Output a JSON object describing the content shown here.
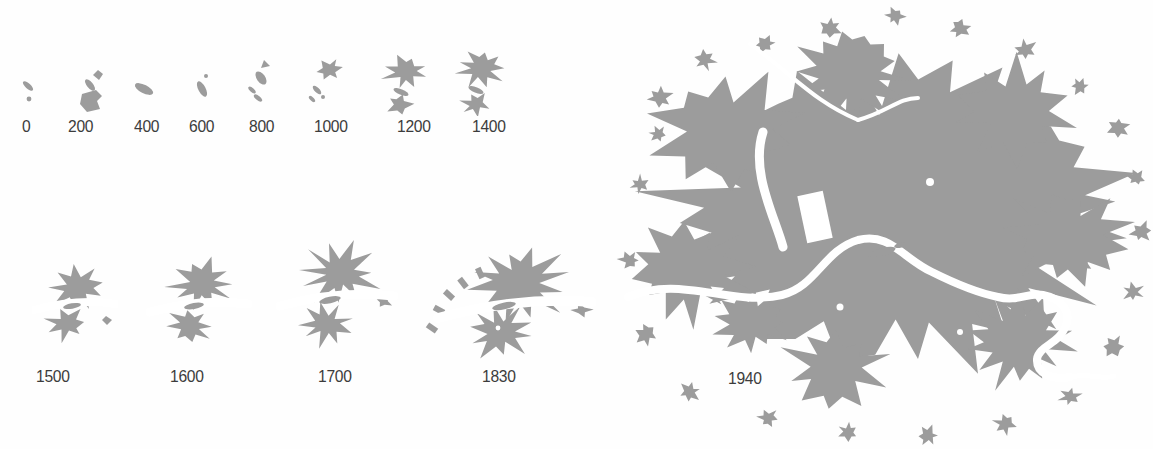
{
  "figure": {
    "colors": {
      "city_fill": "#9c9c9c",
      "river_and_background": "#ffffff",
      "label_text": "#3c3c3c"
    },
    "panels": [
      {
        "year": "0"
      },
      {
        "year": "200"
      },
      {
        "year": "400"
      },
      {
        "year": "600"
      },
      {
        "year": "800"
      },
      {
        "year": "1000"
      },
      {
        "year": "1200"
      },
      {
        "year": "1400"
      },
      {
        "year": "1500"
      },
      {
        "year": "1600"
      },
      {
        "year": "1700"
      },
      {
        "year": "1830"
      },
      {
        "year": "1940"
      }
    ]
  }
}
